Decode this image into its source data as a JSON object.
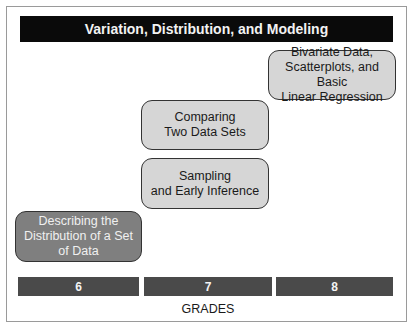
{
  "title": "Variation, Distribution, and Modeling",
  "topics": [
    {
      "label_lines": [
        "Bivariate Data,",
        "Scatterplots, and Basic",
        "Linear Regression"
      ],
      "grade": "8"
    },
    {
      "label_lines": [
        "Comparing",
        "Two Data Sets"
      ],
      "grade": "7"
    },
    {
      "label_lines": [
        "Sampling",
        "and Early Inference"
      ],
      "grade": "7"
    },
    {
      "label_lines": [
        "Describing the",
        "Distribution of a Set",
        "of Data"
      ],
      "grade": "6"
    }
  ],
  "grades": [
    "6",
    "7",
    "8"
  ],
  "axis_label": "GRADES",
  "colors": {
    "title_bar": "#0a0a0a",
    "box_light": "#d6d6d6",
    "box_dark": "#7f7f7f",
    "grade_bar": "#4a4a4a"
  }
}
